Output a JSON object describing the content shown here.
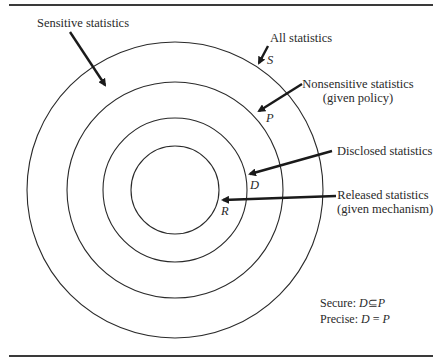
{
  "diagram": {
    "circles": [
      {
        "id": "S",
        "name": "all-statistics-circle",
        "cx": 175,
        "cy": 190,
        "r": 148
      },
      {
        "id": "P",
        "name": "nonsensitive-statistics-circle",
        "cx": 175,
        "cy": 190,
        "r": 108
      },
      {
        "id": "D",
        "name": "disclosed-statistics-circle",
        "cx": 175,
        "cy": 190,
        "r": 72
      },
      {
        "id": "R",
        "name": "released-statistics-circle",
        "cx": 175,
        "cy": 190,
        "r": 44
      }
    ],
    "labels": {
      "sensitive": "Sensitive statistics",
      "all": "All statistics",
      "nonsensitive_line1": "Nonsensitive statistics",
      "nonsensitive_line2": "(given policy)",
      "disclosed": "Disclosed statistics",
      "released_line1": "Released statistics",
      "released_line2": "(given mechanism)"
    },
    "variables": {
      "S": "S",
      "P": "P",
      "D": "D",
      "R": "R"
    },
    "notes": {
      "secure_label": "Secure:",
      "secure_expr_lhs": "D",
      "secure_op": "⊆",
      "secure_expr_rhs": "P",
      "precise_label": "Precise:",
      "precise_expr_lhs": "D",
      "precise_op": "=",
      "precise_expr_rhs": "P"
    },
    "colors": {
      "stroke": "#2a2a2a",
      "background": "#ffffff"
    }
  }
}
